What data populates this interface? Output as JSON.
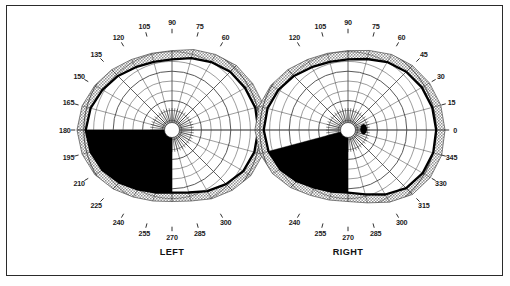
{
  "figure": {
    "kind": "goldmann-visual-field-perimetry-chart",
    "border_color": "#2a2a2a",
    "background": "#ffffff"
  },
  "chart_data": {
    "type": "scatter",
    "title": "",
    "subtitle": "",
    "xlabel": "",
    "ylabel": "",
    "plot_kind": "polar-perimetry",
    "legend_position": "none",
    "grid": true,
    "angular_unit": "degrees",
    "radial_unit": "degrees-eccentricity",
    "radial_rings": 9,
    "radial_ring_step": 10,
    "radial_max": 90,
    "meridian_step": 15,
    "colors": {
      "isopter_line": "#000000",
      "scotoma_fill": "#000000",
      "peripheral_band": "#b9b9b9",
      "grid_line": "#3a3a3a",
      "frame": "#2a2a2a",
      "paper": "#ffffff"
    },
    "charts": [
      {
        "name": "left-eye-field",
        "eye_label": "LEFT",
        "center": {
          "x": 172,
          "y": 130
        },
        "tick_labels_top": [
          "120",
          "105",
          "90",
          "75",
          "60"
        ],
        "tick_labels_left": [
          "135",
          "150",
          "165",
          "180",
          "195",
          "210",
          "225"
        ],
        "tick_labels_bottom": [
          "240",
          "255",
          "270",
          "285",
          "300"
        ],
        "tick_labels_right": [],
        "isopter": {
          "label": "",
          "angles": [
            0,
            15,
            30,
            45,
            60,
            75,
            90,
            105,
            120,
            135,
            150,
            165,
            180,
            195,
            210,
            225,
            240,
            255,
            270,
            285,
            300,
            315,
            330,
            345
          ],
          "radii": [
            88,
            88,
            86,
            84,
            80,
            76,
            72,
            72,
            74,
            78,
            82,
            86,
            88,
            86,
            82,
            76,
            70,
            66,
            64,
            66,
            72,
            78,
            84,
            87
          ]
        },
        "scotoma": {
          "label": "absolute-defect",
          "start_angle": 180,
          "end_angle": 270,
          "shape": "inferior-temporal-wedge-with-vertical-meridian-edge",
          "vertical_edge_meridian": 270
        },
        "blind_spot": {
          "visible": false,
          "note": "merged-into-scotoma"
        },
        "fovea_marker": {
          "visible": true,
          "shape": "circle"
        }
      },
      {
        "name": "right-eye-field",
        "eye_label": "RIGHT",
        "center": {
          "x": 348,
          "y": 130
        },
        "tick_labels_top": [
          "120",
          "105",
          "90",
          "75",
          "60"
        ],
        "tick_labels_left": [],
        "tick_labels_bottom": [
          "240",
          "255",
          "270",
          "285",
          "300"
        ],
        "tick_labels_right": [
          "45",
          "30",
          "15",
          "0",
          "345",
          "330",
          "315"
        ],
        "isopter": {
          "label": "",
          "angles": [
            0,
            15,
            30,
            45,
            60,
            75,
            90,
            105,
            120,
            135,
            150,
            165,
            180,
            195,
            210,
            225,
            240,
            255,
            270,
            285,
            300,
            315,
            330,
            345
          ],
          "radii": [
            90,
            89,
            87,
            84,
            80,
            75,
            72,
            72,
            74,
            78,
            82,
            85,
            86,
            84,
            80,
            74,
            68,
            65,
            64,
            68,
            76,
            84,
            88,
            90
          ]
        },
        "scotoma": {
          "label": "absolute-defect",
          "start_angle": 195,
          "end_angle": 270,
          "shape": "inferior-temporal-wedge-with-vertical-meridian-edge",
          "vertical_edge_meridian": 270
        },
        "blind_spot": {
          "visible": true,
          "angle": 3,
          "radius": 16,
          "shape": "oval"
        },
        "fovea_marker": {
          "visible": true,
          "shape": "circle"
        }
      }
    ]
  }
}
